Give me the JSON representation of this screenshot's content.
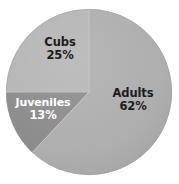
{
  "chart_data": {
    "type": "pie",
    "title": "",
    "subtitle": "",
    "xlabel": "",
    "ylabel": "",
    "legend_position": "none",
    "grid": false,
    "labels_inside_slices": true,
    "categories": [
      "Adults",
      "Cubs",
      "Juveniles"
    ],
    "values": [
      62,
      25,
      13
    ],
    "value_unit": "%",
    "slices": [
      {
        "name": "Adults",
        "value": 62,
        "value_label": "62%",
        "color": "#adadad",
        "text_color": "#1c1c1c",
        "start_angle_deg": 0,
        "end_angle_deg": 223.2
      },
      {
        "name": "Cubs",
        "value": 25,
        "value_label": "25%",
        "color": "#b4b4b4",
        "text_color": "#1c1c1c",
        "start_angle_deg": 270,
        "end_angle_deg": 360
      },
      {
        "name": "Juveniles",
        "value": 13,
        "value_label": "13%",
        "color": "#8a8a8a",
        "text_color": "#ffffff",
        "start_angle_deg": 223.2,
        "end_angle_deg": 270
      }
    ],
    "colors": {
      "background": "#ffffff",
      "adults": "#adadad",
      "cubs": "#b4b4b4",
      "juveniles": "#8a8a8a",
      "divider": "#c9c9c9",
      "label_dark": "#1c1c1c",
      "label_light": "#ffffff"
    }
  },
  "labels": {
    "adults": {
      "name": "Adults",
      "value": "62%"
    },
    "cubs": {
      "name": "Cubs",
      "value": "25%"
    },
    "juveniles": {
      "name": "Juveniles",
      "value": "13%"
    }
  }
}
